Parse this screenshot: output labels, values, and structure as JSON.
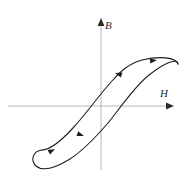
{
  "figure": {
    "kind": "hysteresis-loop-diagram",
    "title": "",
    "background_color": "#ffffff",
    "axes": {
      "color": "#b8b8b8",
      "arrow_color": "#2b2b2b",
      "origin": {
        "x": 101,
        "y": 106
      },
      "horizontal": {
        "name": "H",
        "label": "H",
        "label_x": 163,
        "label_y": 95,
        "x_start": 8,
        "x_end": 168,
        "y": 106
      },
      "vertical": {
        "name": "B",
        "label": "B",
        "label_x": 107,
        "label_y": 26,
        "x": 101,
        "y_start": 170,
        "y_end": 24
      }
    },
    "curve": {
      "name": "hysteresis-loop",
      "color": "#1f1f1f",
      "stroke_width": 1.1,
      "description": "S-shaped magnetic hysteresis loop with small self-crossing loops at upper-right and lower-left saturation ends",
      "upper_branch_path": "M 178 64 C 176 58 160 57 143 61 C 129 65 122 71 113 80 C 100 94 88 112 74 128 C 62 142 50 150 42 150",
      "lower_branch_path": "M 42 150 C 34 150 31 158 36 165 C 42 172 56 168 70 160 C 84 152 95 139 108 124 C 122 108 134 88 148 76 C 162 64 176 58 178 64",
      "arrowheads": [
        {
          "name": "arrow-upper-loop-top",
          "x": 155,
          "y": 61,
          "angle": 352
        },
        {
          "name": "arrow-upper-branch",
          "x": 120,
          "y": 70,
          "angle": 197
        },
        {
          "name": "arrow-lower-branch",
          "x": 80,
          "y": 138,
          "angle": 20
        },
        {
          "name": "arrow-lower-loop-bottom",
          "x": 52,
          "y": 151,
          "angle": 332
        }
      ]
    }
  }
}
